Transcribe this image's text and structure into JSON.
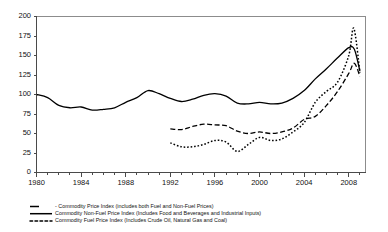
{
  "chart_data": {
    "type": "line",
    "title": "",
    "subtitle": "",
    "xlabel": "",
    "ylabel": "",
    "xlim": [
      1980,
      2009.5
    ],
    "ylim": [
      0,
      200
    ],
    "yticks": [
      0,
      25,
      50,
      75,
      100,
      125,
      150,
      175,
      200
    ],
    "xticks": [
      1980,
      1984,
      1988,
      1992,
      1996,
      2000,
      2004,
      2008
    ],
    "xtick_labels": [
      "1980",
      "1984",
      "1988",
      "1992",
      "1996",
      "2000",
      "2004",
      "2008"
    ],
    "xtick_minor_step": 1,
    "grid": false,
    "legend_position": "below",
    "series": [
      {
        "name": "Commodity Price Index (includes both Fuel and Non-Fuel Prices)",
        "legend_label": "- Commodity Price Index (includes both Fuel and Non-Fuel Prices)",
        "style": "solid",
        "dash": "none",
        "width": 1.3,
        "color": "#000000",
        "x": [
          1980,
          1981,
          1982,
          1983,
          1984,
          1985,
          1986,
          1987,
          1988,
          1989,
          1990,
          1991,
          1992,
          1993,
          1994,
          1995,
          1996,
          1997,
          1998,
          1999,
          2000,
          2001,
          2002,
          2003,
          2004,
          2005,
          2006,
          2007,
          2008,
          2008.5,
          2009
        ],
        "y": [
          100,
          96,
          86,
          83,
          84,
          80,
          81,
          83,
          90,
          96,
          105,
          101,
          95,
          91,
          94,
          99,
          101,
          98,
          89,
          88,
          90,
          88,
          89,
          95,
          105,
          120,
          133,
          147,
          160,
          158,
          130
        ]
      },
      {
        "name": "Commodity Non-Fuel Price Index (Includes Food and Beverages and Industrial Inputs)",
        "legend_label": "Commodity Non-Fuel Price Index (Includes Food and Beverages and Industrial Inputs)",
        "style": "dashed",
        "dash": "5,2.5",
        "width": 1.3,
        "color": "#000000",
        "x": [
          1992,
          1993,
          1994,
          1995,
          1996,
          1997,
          1998,
          1999,
          2000,
          2001,
          2002,
          2003,
          2004,
          2005,
          2006,
          2007,
          2008,
          2008.5,
          2009
        ],
        "y": [
          56,
          55,
          59,
          62,
          61,
          60,
          53,
          50,
          52,
          50,
          52,
          57,
          68,
          72,
          86,
          104,
          127,
          140,
          123
        ]
      },
      {
        "name": "Commodity Fuel Price Index (Includes Crude Oil, Natural Gas and Coal)",
        "legend_label": "Commodity Fuel Price Index (Includes Crude Oil, Natural Gas and Coal)",
        "style": "dotted",
        "dash": "1.6,1.9",
        "width": 1.5,
        "color": "#000000",
        "x": [
          1992,
          1993,
          1994,
          1995,
          1996,
          1997,
          1998,
          1999,
          2000,
          2001,
          2002,
          2003,
          2004,
          2005,
          2006,
          2007,
          2008,
          2008.45,
          2009
        ],
        "y": [
          38,
          33,
          33,
          36,
          41,
          39,
          27,
          36,
          45,
          41,
          43,
          52,
          64,
          90,
          104,
          116,
          150,
          185,
          128
        ]
      }
    ]
  },
  "axes": {
    "y_axis_name": "y-axis",
    "x_axis_name": "x-axis"
  }
}
